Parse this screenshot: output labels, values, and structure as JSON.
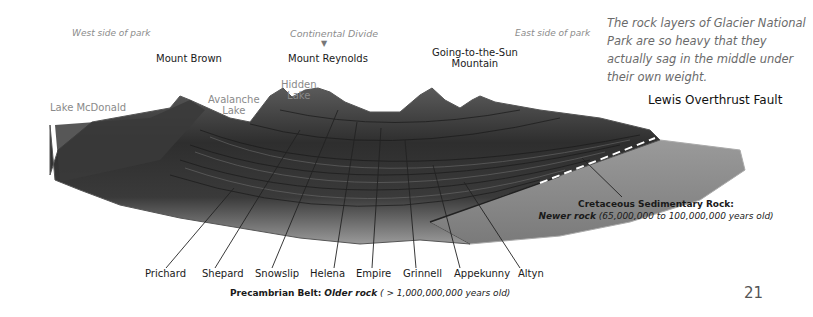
{
  "regions": {
    "west": "West side of park",
    "divide": "Continental Divide",
    "divide_marker": "▼",
    "east": "East side of park"
  },
  "peaks": {
    "mount_brown": "Mount Brown",
    "mount_reynolds": "Mount Reynolds",
    "going_to_the_sun_1": "Going-to-the-Sun",
    "going_to_the_sun_2": "Mountain"
  },
  "lakes": {
    "mcdonald": "Lake McDonald",
    "avalanche_1": "Avalanche",
    "avalanche_2": "Lake",
    "hidden_1": "Hidden",
    "hidden_2": "Lake"
  },
  "caption": "The rock layers of Glacier National Park are so heavy that they actually sag in the middle under their own weight.",
  "fault_label": "Lewis Overthrust Fault",
  "layers": [
    {
      "name": "Prichard"
    },
    {
      "name": "Shepard"
    },
    {
      "name": "Snowslip"
    },
    {
      "name": "Helena"
    },
    {
      "name": "Empire"
    },
    {
      "name": "Grinnell"
    },
    {
      "name": "Appekunny"
    },
    {
      "name": "Altyn"
    }
  ],
  "precambrian": {
    "title": "Precambrian Belt:",
    "subtitle": "Older rock",
    "age": "( > 1,000,000,000 years old)"
  },
  "cretaceous": {
    "title": "Cretaceous Sedimentary Rock:",
    "subtitle": "Newer rock",
    "age": "(65,000,000 to 100,000,000 years old)"
  },
  "page_number": "21",
  "colors": {
    "rock_dark": "#2a2a2a",
    "rock_mid": "#555555",
    "rock_light": "#9a9a9a",
    "cretaceous": "#8c8c8c",
    "label_gray": "#8c8c8c"
  }
}
